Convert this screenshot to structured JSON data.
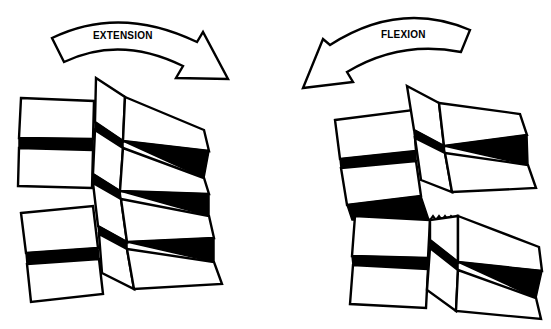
{
  "diagram": {
    "left_panel": {
      "label": "EXTENSION",
      "arrow_direction": "clockwise-right"
    },
    "right_panel": {
      "label": "FLEXION",
      "arrow_direction": "counterclockwise-left"
    },
    "colors": {
      "line": "#000000",
      "fill": "#ffffff",
      "disc": "#000000"
    }
  }
}
